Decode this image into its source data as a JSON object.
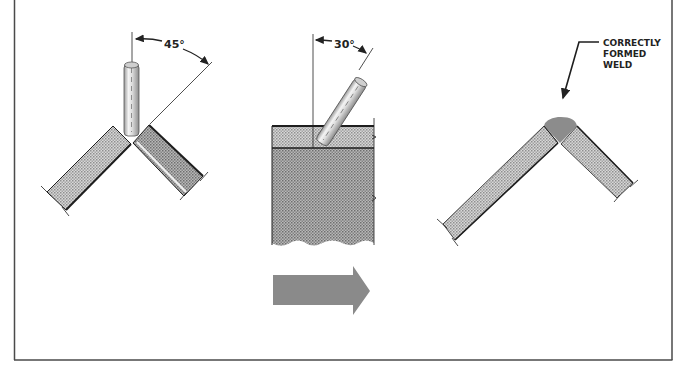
{
  "diagram": {
    "type": "welding-technique-illustration",
    "panels": [
      {
        "id": "corner-joint-45",
        "angle_label": "45°",
        "angle_value": 45,
        "description": "Vertical electrode positioned over open outside corner joint, bisecting the 45° angle"
      },
      {
        "id": "electrode-tilt-30",
        "angle_label": "30°",
        "angle_value": 30,
        "description": "Electrode tilted 30° from vertical in direction of travel over plate cross-section"
      },
      {
        "id": "finished-weld",
        "callout": [
          "CORRECTLY",
          "FORMED",
          "WELD"
        ],
        "description": "Corner joint with correctly formed weld bead"
      }
    ],
    "travel_arrow": {
      "direction": "right",
      "color": "#8a8a8a"
    },
    "colors": {
      "line": "#1e1e1e",
      "plate_fill": "#c9c9c9",
      "plate_dark": "#a9a9a9",
      "weld_fill": "#8c8c8c",
      "frame": "#4a4a4a"
    }
  }
}
